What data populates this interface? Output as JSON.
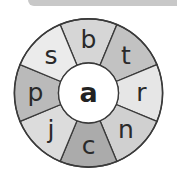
{
  "wheel": {
    "center_letter": "a",
    "segments": [
      {
        "letter": "b",
        "angle": 90,
        "color": "#d6d6d6"
      },
      {
        "letter": "t",
        "angle": 45,
        "color": "#c2c2c2"
      },
      {
        "letter": "r",
        "angle": 0,
        "color": "#e6e6e6"
      },
      {
        "letter": "n",
        "angle": -45,
        "color": "#d0d0d0"
      },
      {
        "letter": "c",
        "angle": -90,
        "color": "#ababab"
      },
      {
        "letter": "j",
        "angle": -135,
        "color": "#dcdcdc"
      },
      {
        "letter": "p",
        "angle": 180,
        "color": "#bababa"
      },
      {
        "letter": "s",
        "angle": 135,
        "color": "#ebebeb"
      }
    ]
  }
}
